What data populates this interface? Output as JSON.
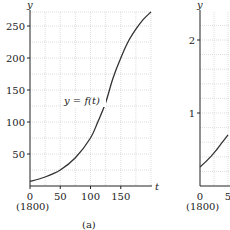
{
  "chart_data": [
    {
      "type": "line",
      "panel_label": "(a)",
      "title": "",
      "xlabel": "t",
      "ylabel": "y",
      "curve_label": "y = f(t)",
      "x_tick_labels": [
        "0",
        "50",
        "100",
        "150"
      ],
      "x_origin_note": "(1800)",
      "y_tick_labels": [
        "50",
        "100",
        "150",
        "200",
        "250"
      ],
      "xlim": [
        0,
        200
      ],
      "ylim": [
        0,
        272
      ],
      "grid": true,
      "x": [
        0,
        25,
        50,
        75,
        100,
        112,
        125,
        137,
        150,
        162,
        175,
        187,
        200
      ],
      "values": [
        7,
        14,
        25,
        44,
        75,
        100,
        130,
        168,
        200,
        225,
        245,
        260,
        272
      ]
    },
    {
      "type": "line",
      "panel_label": "",
      "title": "",
      "xlabel": "",
      "ylabel": "y",
      "x_tick_labels": [
        "0",
        "5"
      ],
      "x_origin_note": "(1800)",
      "y_tick_labels": [
        "1",
        "2"
      ],
      "xlim": [
        0,
        50
      ],
      "ylim": [
        0,
        2.2
      ],
      "grid": true,
      "x": [
        0,
        10,
        20,
        30,
        40,
        50
      ],
      "values": [
        0.26,
        0.33,
        0.41,
        0.5,
        0.6,
        0.7
      ]
    }
  ]
}
